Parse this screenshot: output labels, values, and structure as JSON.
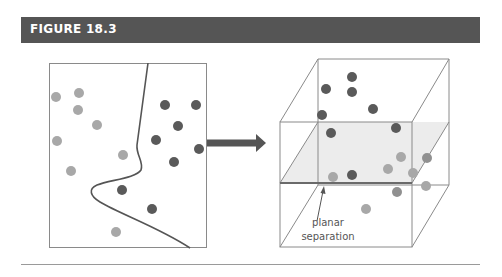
{
  "header": {
    "title": "FIGURE 18.3"
  },
  "colors": {
    "header_bg": "#555555",
    "class_a_dot": "#a8a8a8",
    "class_b_dot": "#5a5a5a",
    "line": "#555555",
    "plane": "#ececec"
  },
  "left_panel": {
    "description": "2D feature space with non-linear decision boundary",
    "light_dots": [
      [
        56,
        97
      ],
      [
        79,
        93
      ],
      [
        78,
        110
      ],
      [
        97,
        125
      ],
      [
        57,
        141
      ],
      [
        123,
        155
      ],
      [
        71,
        171
      ],
      [
        116,
        232
      ]
    ],
    "dark_dots": [
      [
        165,
        105
      ],
      [
        196,
        105
      ],
      [
        178,
        126
      ],
      [
        156,
        140
      ],
      [
        199,
        149
      ],
      [
        174,
        162
      ],
      [
        122,
        190
      ],
      [
        152,
        209
      ]
    ]
  },
  "arrow": {
    "direction": "right"
  },
  "right_panel": {
    "description": "3D feature space with planar separation",
    "dark_dots": [
      [
        352,
        77
      ],
      [
        326,
        89
      ],
      [
        352,
        92
      ],
      [
        373,
        109
      ],
      [
        322,
        115
      ],
      [
        331,
        133
      ],
      [
        396,
        128
      ],
      [
        352,
        175
      ]
    ],
    "mid_dots": [
      [
        427,
        158
      ],
      [
        397,
        192
      ]
    ],
    "light_dots": [
      [
        401,
        157
      ],
      [
        388,
        169
      ],
      [
        333,
        177
      ],
      [
        413,
        173
      ],
      [
        426,
        186
      ],
      [
        366,
        209
      ]
    ],
    "annotation": {
      "line1": "planar",
      "line2": "separation"
    }
  }
}
